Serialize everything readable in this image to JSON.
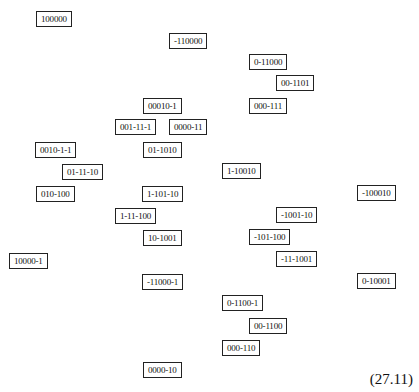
{
  "diagram": {
    "nodes": [
      {
        "label": "100000",
        "x": 36,
        "y": 11
      },
      {
        "label": "-110000",
        "x": 169,
        "y": 33
      },
      {
        "label": "0-11000",
        "x": 249,
        "y": 54
      },
      {
        "label": "00-1101",
        "x": 276,
        "y": 75
      },
      {
        "label": "00010-1",
        "x": 143,
        "y": 98
      },
      {
        "label": "000-111",
        "x": 249,
        "y": 98
      },
      {
        "label": "001-11-1",
        "x": 115,
        "y": 119
      },
      {
        "label": "0000-11",
        "x": 169,
        "y": 119
      },
      {
        "label": "0010-1-1",
        "x": 35,
        "y": 142
      },
      {
        "label": "01-1010",
        "x": 143,
        "y": 142
      },
      {
        "label": "01-11-10",
        "x": 62,
        "y": 164
      },
      {
        "label": "1-10010",
        "x": 222,
        "y": 163
      },
      {
        "label": "010-100",
        "x": 36,
        "y": 186
      },
      {
        "label": "1-101-10",
        "x": 142,
        "y": 186
      },
      {
        "label": "-100010",
        "x": 357,
        "y": 185
      },
      {
        "label": "1-11-100",
        "x": 115,
        "y": 208
      },
      {
        "label": "-1001-10",
        "x": 276,
        "y": 207
      },
      {
        "label": "10-1001",
        "x": 143,
        "y": 230
      },
      {
        "label": "-101-100",
        "x": 249,
        "y": 229
      },
      {
        "label": "10000-1",
        "x": 9,
        "y": 253
      },
      {
        "label": "-11-1001",
        "x": 276,
        "y": 251
      },
      {
        "label": "-11000-1",
        "x": 142,
        "y": 274
      },
      {
        "label": "0-10001",
        "x": 357,
        "y": 273
      },
      {
        "label": "0-1100-1",
        "x": 222,
        "y": 295
      },
      {
        "label": "00-1100",
        "x": 249,
        "y": 318
      },
      {
        "label": "000-110",
        "x": 222,
        "y": 340
      },
      {
        "label": "0000-10",
        "x": 143,
        "y": 362
      }
    ]
  },
  "equation_number": "(27.11)"
}
